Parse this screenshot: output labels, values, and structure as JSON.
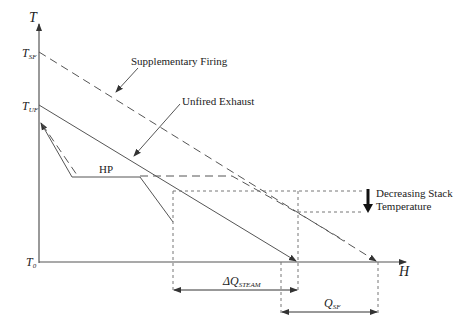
{
  "diagram": {
    "axes": {
      "y_label": "T",
      "x_label": "H",
      "ticks": [
        {
          "main": "T",
          "sub": "SF"
        },
        {
          "main": "T",
          "sub": "UF"
        },
        {
          "main": "T",
          "sub": "0"
        }
      ]
    },
    "annotations": {
      "supplementary": "Supplementary Firing",
      "unfired": "Unfired Exhaust",
      "hp": "HP",
      "stack_line1": "Decreasing Stack",
      "stack_line2": "Temperature"
    },
    "dimensions": {
      "dq_prefix": "ΔQ",
      "dq_sub": "STEAM",
      "qsf_main": "Q",
      "qsf_sub": "SF"
    },
    "colors": {
      "line": "#555555",
      "text": "#222222"
    }
  }
}
